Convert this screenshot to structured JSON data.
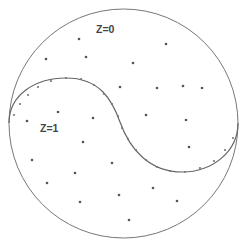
{
  "diagram": {
    "type": "region-partition",
    "circle": {
      "cx": 123.5,
      "cy": 123.5,
      "r": 114.5,
      "stroke": "#777777"
    },
    "boundary": {
      "path": "M 9 123 C 9 95, 35 78, 66 78 C 100 78, 112 100, 120 122 C 130 150, 150 172, 182 172 C 212 172, 238 152, 238 123",
      "stroke": "#666666",
      "markers": [
        [
          14,
          115
        ],
        [
          20,
          104
        ],
        [
          28,
          95
        ],
        [
          38,
          87
        ],
        [
          51,
          81
        ],
        [
          66,
          78
        ],
        [
          81,
          79
        ],
        [
          94,
          85
        ],
        [
          104,
          94
        ],
        [
          112,
          104
        ],
        [
          118,
          116
        ],
        [
          122,
          128
        ],
        [
          128,
          139
        ],
        [
          136,
          150
        ],
        [
          146,
          160
        ],
        [
          157,
          167
        ],
        [
          170,
          171
        ],
        [
          185,
          172
        ],
        [
          200,
          168
        ],
        [
          214,
          161
        ],
        [
          225,
          150
        ],
        [
          233,
          138
        ]
      ],
      "marker_color": "#777777"
    },
    "labels": [
      {
        "text": "Z=0",
        "x": 96,
        "y": 33,
        "name": "region-label-z0"
      },
      {
        "text": "Z=1",
        "x": 40,
        "y": 132,
        "name": "region-label-z1"
      }
    ],
    "regions": [
      {
        "name": "Z=0",
        "points": [
          [
            79,
            39
          ],
          [
            166,
            44
          ],
          [
            46,
            59
          ],
          [
            86,
            57
          ],
          [
            133,
            63
          ],
          [
            120,
            87
          ],
          [
            157,
            88
          ],
          [
            183,
            86
          ],
          [
            202,
            88
          ],
          [
            146,
            115
          ],
          [
            186,
            120
          ],
          [
            189,
            147
          ]
        ]
      },
      {
        "name": "Z=1",
        "points": [
          [
            58,
            112
          ],
          [
            27,
            121
          ],
          [
            93,
            118
          ],
          [
            83,
            142
          ],
          [
            32,
            160
          ],
          [
            112,
            163
          ],
          [
            75,
            173
          ],
          [
            47,
            183
          ],
          [
            153,
            188
          ],
          [
            119,
            195
          ],
          [
            80,
            202
          ],
          [
            177,
            201
          ],
          [
            129,
            220
          ]
        ]
      }
    ],
    "point_color": "#555555"
  }
}
